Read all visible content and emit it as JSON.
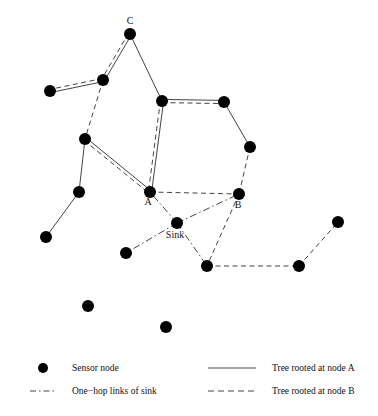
{
  "figure": {
    "title": "",
    "background": "#ffffff",
    "node_color": "#000000",
    "line_color": "#444444"
  },
  "labels": {
    "c": "C",
    "a": "A",
    "b": "B",
    "sink": "Sink"
  },
  "legend": {
    "sensor_node": "Sensor node",
    "one_hop": "One−hop links of sink",
    "tree_a": "Tree rooted at node A",
    "tree_b": "Tree rooted at node B"
  },
  "chart_data": {
    "type": "diagram",
    "title": "",
    "xlabel": "",
    "ylabel": "",
    "xlim": [
      0,
      378
    ],
    "ylim": [
      0,
      416
    ],
    "grid": false,
    "legend_position": "bottom",
    "node_radius": 6,
    "nodes": [
      {
        "id": "c",
        "x": 130,
        "y": 34,
        "label": "C",
        "label_dx": 0,
        "label_dy": -10
      },
      {
        "id": "n1",
        "x": 103,
        "y": 80,
        "label": "",
        "label_dx": 0,
        "label_dy": 0
      },
      {
        "id": "n2",
        "x": 50,
        "y": 91,
        "label": "",
        "label_dx": 0,
        "label_dy": 0
      },
      {
        "id": "n3",
        "x": 162,
        "y": 101,
        "label": "",
        "label_dx": 0,
        "label_dy": 0
      },
      {
        "id": "n4",
        "x": 224,
        "y": 102,
        "label": "",
        "label_dx": 0,
        "label_dy": 0
      },
      {
        "id": "n5",
        "x": 250,
        "y": 147,
        "label": "",
        "label_dx": 0,
        "label_dy": 0
      },
      {
        "id": "n6",
        "x": 85,
        "y": 139,
        "label": "",
        "label_dx": 0,
        "label_dy": 0
      },
      {
        "id": "n7",
        "x": 79,
        "y": 192,
        "label": "",
        "label_dx": 0,
        "label_dy": 0
      },
      {
        "id": "n8",
        "x": 46,
        "y": 237,
        "label": "",
        "label_dx": 0,
        "label_dy": 0
      },
      {
        "id": "a",
        "x": 150,
        "y": 192,
        "label": "A",
        "label_dx": -2,
        "label_dy": 13
      },
      {
        "id": "b",
        "x": 239,
        "y": 194,
        "label": "B",
        "label_dx": -1,
        "label_dy": 14
      },
      {
        "id": "sk",
        "x": 177,
        "y": 223,
        "label": "Sink",
        "label_dx": -2,
        "label_dy": 15
      },
      {
        "id": "n9",
        "x": 126,
        "y": 253,
        "label": "",
        "label_dx": 0,
        "label_dy": 0
      },
      {
        "id": "n10",
        "x": 207,
        "y": 266,
        "label": "",
        "label_dx": 0,
        "label_dy": 0
      },
      {
        "id": "n11",
        "x": 299,
        "y": 266,
        "label": "",
        "label_dx": 0,
        "label_dy": 0
      },
      {
        "id": "n12",
        "x": 338,
        "y": 222,
        "label": "",
        "label_dx": 0,
        "label_dy": 0
      },
      {
        "id": "n13",
        "x": 88,
        "y": 306,
        "label": "",
        "label_dx": 0,
        "label_dy": 0
      },
      {
        "id": "n14",
        "x": 166,
        "y": 327,
        "label": "",
        "label_dx": 0,
        "label_dy": 0
      }
    ],
    "edges_tree_a": [
      {
        "from": "c",
        "to": "n1"
      },
      {
        "from": "n1",
        "to": "n2"
      },
      {
        "from": "c",
        "to": "n3"
      },
      {
        "from": "n3",
        "to": "n4"
      },
      {
        "from": "n4",
        "to": "n5"
      },
      {
        "from": "n3",
        "to": "a"
      },
      {
        "from": "n6",
        "to": "a"
      },
      {
        "from": "n6",
        "to": "n7"
      },
      {
        "from": "n7",
        "to": "n8"
      }
    ],
    "edges_tree_b": [
      {
        "from": "c",
        "to": "n1"
      },
      {
        "from": "n1",
        "to": "n2"
      },
      {
        "from": "n1",
        "to": "n6"
      },
      {
        "from": "n6",
        "to": "a"
      },
      {
        "from": "n3",
        "to": "a"
      },
      {
        "from": "n3",
        "to": "n4"
      },
      {
        "from": "n5",
        "to": "b"
      },
      {
        "from": "a",
        "to": "b"
      },
      {
        "from": "b",
        "to": "n10"
      },
      {
        "from": "n10",
        "to": "n11"
      },
      {
        "from": "n11",
        "to": "n12"
      }
    ],
    "edges_sink": [
      {
        "from": "sk",
        "to": "a"
      },
      {
        "from": "sk",
        "to": "b"
      },
      {
        "from": "sk",
        "to": "n9"
      },
      {
        "from": "sk",
        "to": "n10"
      }
    ],
    "legend_entries": [
      {
        "key": "sensor_node",
        "style": "dot",
        "label": "Sensor node"
      },
      {
        "key": "one_hop",
        "style": "dashdot",
        "label": "One−hop links of sink"
      },
      {
        "key": "tree_a",
        "style": "solid",
        "label": "Tree rooted at node A"
      },
      {
        "key": "tree_b",
        "style": "dashed",
        "label": "Tree rooted at node B"
      }
    ]
  }
}
